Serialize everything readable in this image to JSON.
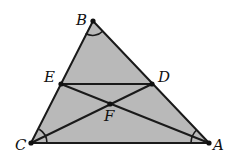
{
  "diagram": {
    "type": "triangle-geometry",
    "fill_color": "#b9b9b9",
    "stroke_color": "#1a1a1a",
    "points": {
      "A": {
        "label": "A",
        "x": 209,
        "y": 143
      },
      "B": {
        "label": "B",
        "x": 93,
        "y": 21
      },
      "C": {
        "label": "C",
        "x": 31,
        "y": 143
      },
      "D": {
        "label": "D",
        "x": 152,
        "y": 84
      },
      "E": {
        "label": "E",
        "x": 61,
        "y": 84
      },
      "F": {
        "label": "F",
        "x": 110,
        "y": 104
      }
    },
    "segments": [
      "AB",
      "BC",
      "CA",
      "ED",
      "EA",
      "CD"
    ],
    "angle_marks": [
      "B",
      "C",
      "A"
    ]
  }
}
